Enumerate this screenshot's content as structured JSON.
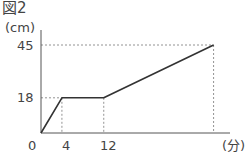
{
  "figure_label": "図2",
  "chart_data": {
    "type": "line",
    "title": "図2",
    "xlabel": "(分)",
    "ylabel": "(cm)",
    "x": [
      0,
      4,
      12,
      33
    ],
    "series": [
      {
        "name": "height",
        "values": [
          0,
          18,
          18,
          45
        ]
      }
    ],
    "x_ticks": [
      "0",
      "4",
      "12"
    ],
    "y_ticks": [
      "18",
      "45"
    ],
    "xlim": [
      0,
      36
    ],
    "ylim": [
      0,
      45
    ],
    "grid": false,
    "guides": "dashed reference lines to (4,18), (12,18), (33,45)"
  },
  "labels": {
    "y_unit": "(cm)",
    "x_unit": "(分)",
    "tick_45": "45",
    "tick_18": "18",
    "tick_0": "0",
    "tick_4": "4",
    "tick_12": "12"
  }
}
